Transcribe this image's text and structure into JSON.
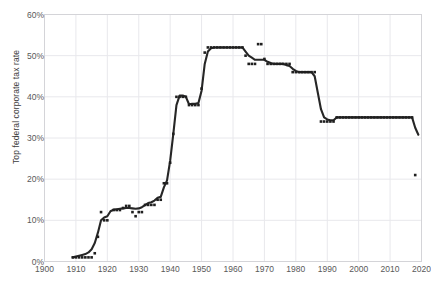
{
  "chart_data": {
    "type": "line",
    "title": "",
    "subtitle": "",
    "xlabel": "",
    "ylabel": "Top federal corporate tax rate",
    "xlim": [
      1900,
      2020
    ],
    "ylim": [
      0,
      60
    ],
    "grid": true,
    "legend": null,
    "x_ticks": [
      "1900",
      "1910",
      "1920",
      "1930",
      "1940",
      "1950",
      "1960",
      "1970",
      "1980",
      "1990",
      "2000",
      "2010",
      "2020"
    ],
    "x_tick_values": [
      1900,
      1910,
      1920,
      1930,
      1940,
      1950,
      1960,
      1970,
      1980,
      1990,
      2000,
      2010,
      2020
    ],
    "y_ticks": [
      "0%",
      "10%",
      "20%",
      "30%",
      "40%",
      "50%",
      "60%"
    ],
    "y_tick_values": [
      0,
      10,
      20,
      30,
      40,
      50,
      60
    ],
    "series": [
      {
        "name": "Top federal corporate tax rate (trend line)",
        "type": "line",
        "color": "#262626",
        "x": [
          1909,
          1910,
          1911,
          1912,
          1913,
          1914,
          1915,
          1916,
          1917,
          1918,
          1919,
          1920,
          1921,
          1922,
          1923,
          1924,
          1925,
          1926,
          1927,
          1928,
          1929,
          1930,
          1931,
          1932,
          1933,
          1934,
          1935,
          1936,
          1937,
          1938,
          1939,
          1940,
          1941,
          1942,
          1943,
          1944,
          1945,
          1946,
          1947,
          1948,
          1949,
          1950,
          1951,
          1952,
          1953,
          1954,
          1955,
          1956,
          1957,
          1958,
          1959,
          1960,
          1961,
          1962,
          1963,
          1964,
          1965,
          1966,
          1967,
          1968,
          1969,
          1970,
          1971,
          1972,
          1973,
          1974,
          1975,
          1976,
          1977,
          1978,
          1979,
          1980,
          1981,
          1982,
          1983,
          1984,
          1985,
          1986,
          1987,
          1988,
          1989,
          1990,
          1991,
          1992,
          1993,
          1994,
          1995,
          2000,
          2005,
          2010,
          2012,
          2015,
          2017,
          2018,
          2019
        ],
        "y": [
          1.0,
          1.2,
          1.4,
          1.6,
          1.8,
          2.2,
          3.0,
          4.5,
          7.0,
          10.0,
          10.7,
          11.0,
          12.2,
          12.6,
          12.7,
          12.8,
          12.9,
          13.0,
          13.0,
          12.9,
          12.8,
          12.9,
          13.2,
          13.7,
          14.2,
          14.4,
          14.8,
          15.5,
          15.7,
          18.0,
          19.7,
          24.5,
          31.0,
          38.0,
          40.3,
          40.3,
          40.0,
          38.2,
          38.3,
          38.3,
          38.5,
          41.5,
          48.0,
          51.0,
          51.8,
          52.0,
          52.0,
          52.0,
          52.0,
          52.0,
          52.0,
          52.0,
          52.0,
          52.0,
          52.0,
          51.0,
          50.0,
          49.5,
          49.0,
          49.0,
          49.0,
          49.0,
          48.5,
          48.2,
          48.0,
          48.0,
          48.0,
          48.0,
          47.7,
          47.5,
          46.8,
          46.3,
          46.0,
          46.0,
          46.0,
          46.0,
          46.0,
          45.0,
          41.0,
          37.0,
          35.0,
          34.5,
          34.3,
          34.3,
          35.0,
          35.0,
          35.0,
          35.0,
          35.0,
          35.0,
          35.0,
          35.0,
          35.0,
          32.5,
          30.8
        ]
      },
      {
        "name": "Top federal corporate tax rate (statutory rate markers)",
        "type": "scatter",
        "color": "#1f1f1f",
        "points": [
          [
            1909,
            1.0
          ],
          [
            1910,
            1.0
          ],
          [
            1911,
            1.0
          ],
          [
            1912,
            1.0
          ],
          [
            1913,
            1.0
          ],
          [
            1914,
            1.0
          ],
          [
            1915,
            1.0
          ],
          [
            1916,
            2.0
          ],
          [
            1917,
            6.0
          ],
          [
            1918,
            12.0
          ],
          [
            1919,
            10.0
          ],
          [
            1920,
            10.0
          ],
          [
            1922,
            12.5
          ],
          [
            1923,
            12.5
          ],
          [
            1924,
            12.5
          ],
          [
            1925,
            13.0
          ],
          [
            1926,
            13.5
          ],
          [
            1927,
            13.5
          ],
          [
            1928,
            12.0
          ],
          [
            1929,
            11.0
          ],
          [
            1930,
            12.0
          ],
          [
            1931,
            12.0
          ],
          [
            1932,
            13.75
          ],
          [
            1933,
            13.75
          ],
          [
            1934,
            13.75
          ],
          [
            1935,
            13.75
          ],
          [
            1936,
            15.0
          ],
          [
            1937,
            15.0
          ],
          [
            1938,
            19.0
          ],
          [
            1939,
            19.0
          ],
          [
            1940,
            24.0
          ],
          [
            1941,
            31.0
          ],
          [
            1942,
            40.0
          ],
          [
            1943,
            40.0
          ],
          [
            1944,
            40.0
          ],
          [
            1945,
            40.0
          ],
          [
            1946,
            38.0
          ],
          [
            1947,
            38.0
          ],
          [
            1948,
            38.0
          ],
          [
            1949,
            38.0
          ],
          [
            1950,
            42.0
          ],
          [
            1951,
            50.75
          ],
          [
            1952,
            52.0
          ],
          [
            1953,
            52.0
          ],
          [
            1954,
            52.0
          ],
          [
            1955,
            52.0
          ],
          [
            1956,
            52.0
          ],
          [
            1957,
            52.0
          ],
          [
            1958,
            52.0
          ],
          [
            1959,
            52.0
          ],
          [
            1960,
            52.0
          ],
          [
            1961,
            52.0
          ],
          [
            1962,
            52.0
          ],
          [
            1963,
            52.0
          ],
          [
            1964,
            50.0
          ],
          [
            1965,
            48.0
          ],
          [
            1966,
            48.0
          ],
          [
            1967,
            48.0
          ],
          [
            1968,
            52.8
          ],
          [
            1969,
            52.8
          ],
          [
            1970,
            49.2
          ],
          [
            1971,
            48.0
          ],
          [
            1972,
            48.0
          ],
          [
            1973,
            48.0
          ],
          [
            1974,
            48.0
          ],
          [
            1975,
            48.0
          ],
          [
            1976,
            48.0
          ],
          [
            1977,
            48.0
          ],
          [
            1978,
            48.0
          ],
          [
            1979,
            46.0
          ],
          [
            1980,
            46.0
          ],
          [
            1981,
            46.0
          ],
          [
            1982,
            46.0
          ],
          [
            1983,
            46.0
          ],
          [
            1984,
            46.0
          ],
          [
            1985,
            46.0
          ],
          [
            1986,
            46.0
          ],
          [
            1988,
            34.0
          ],
          [
            1989,
            34.0
          ],
          [
            1990,
            34.0
          ],
          [
            1991,
            34.0
          ],
          [
            1992,
            34.0
          ],
          [
            1993,
            35.0
          ],
          [
            1994,
            35.0
          ],
          [
            1995,
            35.0
          ],
          [
            1996,
            35.0
          ],
          [
            1997,
            35.0
          ],
          [
            1998,
            35.0
          ],
          [
            1999,
            35.0
          ],
          [
            2000,
            35.0
          ],
          [
            2001,
            35.0
          ],
          [
            2002,
            35.0
          ],
          [
            2003,
            35.0
          ],
          [
            2004,
            35.0
          ],
          [
            2005,
            35.0
          ],
          [
            2006,
            35.0
          ],
          [
            2007,
            35.0
          ],
          [
            2008,
            35.0
          ],
          [
            2009,
            35.0
          ],
          [
            2010,
            35.0
          ],
          [
            2011,
            35.0
          ],
          [
            2012,
            35.0
          ],
          [
            2013,
            35.0
          ],
          [
            2014,
            35.0
          ],
          [
            2015,
            35.0
          ],
          [
            2016,
            35.0
          ],
          [
            2017,
            35.0
          ],
          [
            2018,
            21.0
          ]
        ]
      }
    ],
    "notes": [
      "Isolated marker at 21% in 2018 (Tax Cuts and Jobs Act).",
      "Markers at 52.8% in 1968-1969 reflect the Vietnam surtax.",
      "Line reaches a plateau of 52% from 1952 through 1963."
    ]
  },
  "axes": {
    "y_axis_title": "Top federal corporate tax rate",
    "grid_color": "#e8e8ec",
    "axis_color": "#d4d4d8",
    "tick_text_color": "#595959",
    "line_color": "#262626",
    "marker_color": "#1f1f1f",
    "background": "#ffffff"
  }
}
